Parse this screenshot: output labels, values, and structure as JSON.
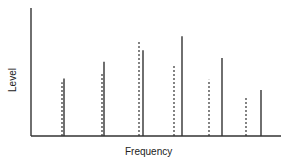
{
  "chart_data": {
    "type": "bar",
    "subtype": "line-spectrum",
    "title": "",
    "xlabel": "Frequency",
    "ylabel": "Level",
    "grid": false,
    "legend": null,
    "ylim": [
      0,
      100
    ],
    "tick_labels": {
      "x": [],
      "y": []
    },
    "categories": [
      "1",
      "2",
      "3",
      "4",
      "5",
      "6"
    ],
    "series": [
      {
        "name": "dotted",
        "style": "dashed",
        "x": [
          62,
          102,
          139,
          174,
          209,
          246
        ],
        "values": [
          42,
          49,
          74,
          55,
          44,
          31
        ]
      },
      {
        "name": "solid",
        "style": "solid",
        "x": [
          64,
          104,
          143,
          182,
          222,
          261
        ],
        "values": [
          45,
          58,
          67,
          78,
          61,
          36
        ]
      }
    ]
  },
  "axes": {
    "x_label": "Frequency",
    "y_label": "Level"
  },
  "colors": {
    "line": "#333333",
    "axis": "#333333",
    "background": "#ffffff"
  }
}
